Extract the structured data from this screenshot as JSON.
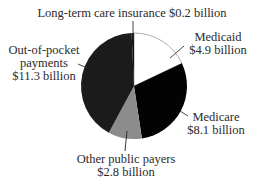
{
  "chart_data": {
    "type": "pie",
    "title": "",
    "unit": "billion USD",
    "start_angle_deg": 0,
    "direction": "clockwise",
    "center": [
      134,
      86
    ],
    "radius": 53,
    "slices": [
      {
        "key": "medicaid",
        "name": "Medicaid",
        "value": 4.9,
        "value_label": "$4.9 billion",
        "color": "#ffffff",
        "stroke": "#9a9a9a",
        "label_lines": [
          "Medicaid",
          "$4.9 billion"
        ],
        "label_pos": [
          218,
          41
        ],
        "label_anchor": "middle",
        "leader": [
          [
            170,
            58
          ],
          [
            184,
            46
          ]
        ]
      },
      {
        "key": "medicare",
        "name": "Medicare",
        "value": 8.1,
        "value_label": "$8.1 billion",
        "color": "#030303",
        "stroke": "none",
        "label_lines": [
          "Medicare",
          "$8.1 billion"
        ],
        "label_pos": [
          216,
          121
        ],
        "label_anchor": "middle",
        "leader": [
          [
            180,
            111
          ],
          [
            188,
            116
          ]
        ]
      },
      {
        "key": "other_public",
        "name": "Other public payers",
        "value": 2.8,
        "value_label": "$2.8 billion",
        "color": "#8c8c8c",
        "stroke": "none",
        "label_lines": [
          "Other public payers",
          "$2.8 billion"
        ],
        "label_pos": [
          126,
          163
        ],
        "label_anchor": "middle",
        "leader": [
          [
            127,
            131
          ],
          [
            125,
            151
          ]
        ]
      },
      {
        "key": "out_of_pocket",
        "name": "Out-of-pocket payments",
        "value": 11.3,
        "value_label": "$11.3 billion",
        "color": "#1b1b1b",
        "stroke": "none",
        "label_lines": [
          "Out-of-pocket",
          "payments",
          "$11.3 billion"
        ],
        "label_pos": [
          44,
          54
        ],
        "label_anchor": "middle",
        "leader": [
          [
            78,
            64
          ],
          [
            87,
            68
          ]
        ]
      },
      {
        "key": "long_term_care_insurance",
        "name": "Long-term care insurance",
        "value": 0.2,
        "value_label": "$0.2 billion",
        "color": "#111111",
        "stroke": "none",
        "label_lines": [
          "Long-term care insurance $0.2 billion"
        ],
        "label_pos": [
          132,
          17
        ],
        "label_anchor": "middle",
        "leader": [
          [
            133,
            21
          ],
          [
            133,
            40
          ]
        ]
      }
    ],
    "total": 27.3,
    "legend": null
  }
}
